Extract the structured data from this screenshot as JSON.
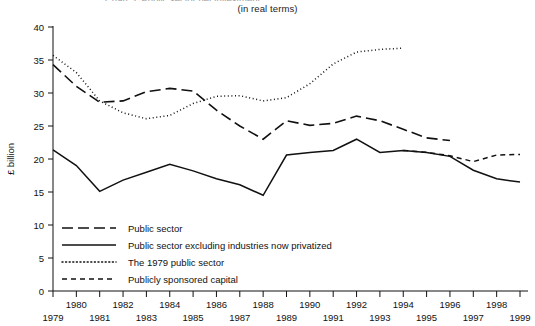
{
  "figure": {
    "clipped_title": "Chart 3: Public sector net investment",
    "subtitle": "(in real terms)"
  },
  "chart_data": {
    "type": "line",
    "title": "",
    "subtitle": "(in real terms)",
    "xlabel": "",
    "ylabel": "£ billion",
    "xlim": [
      1979,
      1999
    ],
    "ylim": [
      0,
      40
    ],
    "yticks": [
      0,
      5,
      10,
      15,
      20,
      25,
      30,
      35,
      40
    ],
    "ytick_labels": [
      "0",
      "5",
      "10",
      "15",
      "20",
      "25",
      "30",
      "35",
      "40"
    ],
    "xticks": [
      1979,
      1980,
      1981,
      1982,
      1983,
      1984,
      1985,
      1986,
      1987,
      1988,
      1989,
      1990,
      1991,
      1992,
      1993,
      1994,
      1995,
      1996,
      1997,
      1998,
      1999
    ],
    "xtick_labels": [
      "1979",
      "1980",
      "1981",
      "1982",
      "1983",
      "1984",
      "1985",
      "1986",
      "1987",
      "1988",
      "1989",
      "1990",
      "1991",
      "1992",
      "1993",
      "1994",
      "1995",
      "1996",
      "1997",
      "1998",
      "1999"
    ],
    "xtick_rows": [
      1,
      0,
      1,
      0,
      1,
      0,
      1,
      0,
      1,
      0,
      1,
      0,
      1,
      0,
      1,
      0,
      1,
      0,
      1,
      0,
      1
    ],
    "grid": false,
    "legend_position": "lower-left-inside",
    "series": [
      {
        "name": "Public sector",
        "style": "long-dash",
        "x": [
          1979,
          1980,
          1981,
          1982,
          1983,
          1984,
          1985,
          1986,
          1987,
          1988,
          1989,
          1990,
          1991,
          1992,
          1993,
          1994,
          1995,
          1996
        ],
        "values": [
          34.3,
          31.0,
          28.6,
          28.8,
          30.2,
          30.7,
          30.3,
          27.4,
          25.0,
          23.0,
          25.8,
          25.1,
          25.4,
          26.5,
          25.8,
          24.5,
          23.2,
          22.8
        ]
      },
      {
        "name": "Public sector excluding industries now privatized",
        "style": "solid",
        "x": [
          1979,
          1980,
          1981,
          1982,
          1983,
          1984,
          1985,
          1986,
          1987,
          1988,
          1989,
          1990,
          1991,
          1992,
          1993,
          1994,
          1995,
          1996,
          1997,
          1998,
          1999
        ],
        "values": [
          21.4,
          19.0,
          15.1,
          16.8,
          18.0,
          19.2,
          18.2,
          17.0,
          16.1,
          14.5,
          20.6,
          21.0,
          21.3,
          23.0,
          21.0,
          21.3,
          21.0,
          20.4,
          18.3,
          17.0,
          16.5
        ]
      },
      {
        "name": "The 1979 public sector",
        "style": "dotted",
        "x": [
          1979,
          1980,
          1981,
          1982,
          1983,
          1984,
          1985,
          1986,
          1987,
          1988,
          1989,
          1990,
          1991,
          1992,
          1993,
          1994
        ],
        "values": [
          35.7,
          33.1,
          28.8,
          27.0,
          26.1,
          26.6,
          28.4,
          29.5,
          29.6,
          28.8,
          29.3,
          31.4,
          34.4,
          36.2,
          36.6,
          36.8
        ]
      },
      {
        "name": "Publicly sponsored capital",
        "style": "short-dash",
        "x": [
          1994,
          1995,
          1996,
          1997,
          1998,
          1999
        ],
        "values": [
          21.3,
          21.0,
          20.5,
          19.6,
          20.6,
          20.7
        ]
      }
    ]
  },
  "legend": {
    "items": [
      {
        "label": "Public sector",
        "style": "long-dash"
      },
      {
        "label": "Public sector excluding industries now privatized",
        "style": "solid"
      },
      {
        "label": "The 1979 public sector",
        "style": "dotted"
      },
      {
        "label": "Publicly sponsored capital",
        "style": "short-dash"
      }
    ]
  }
}
